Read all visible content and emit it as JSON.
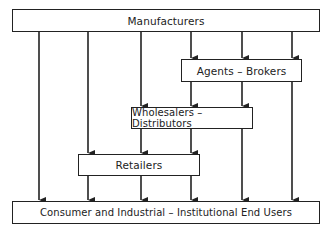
{
  "diagram": {
    "type": "flow",
    "nodes": [
      {
        "id": "manufacturers",
        "label": "Manufacturers"
      },
      {
        "id": "agents",
        "label": "Agents – Brokers"
      },
      {
        "id": "wholesalers",
        "label": "Wholesalers – Distributors"
      },
      {
        "id": "retailers",
        "label": "Retailers"
      },
      {
        "id": "end_users",
        "label": "Consumer and Industrial – Institutional End Users"
      }
    ],
    "edges": [
      {
        "from": "manufacturers",
        "to": "end_users"
      },
      {
        "from": "manufacturers",
        "to": "retailers"
      },
      {
        "from": "manufacturers",
        "to": "wholesalers"
      },
      {
        "from": "manufacturers",
        "to": "agents"
      },
      {
        "from": "manufacturers",
        "to": "agents"
      },
      {
        "from": "manufacturers",
        "to": "agents"
      },
      {
        "from": "agents",
        "to": "wholesalers"
      },
      {
        "from": "agents",
        "to": "wholesalers"
      },
      {
        "from": "agents",
        "to": "end_users"
      },
      {
        "from": "wholesalers",
        "to": "retailers"
      },
      {
        "from": "wholesalers",
        "to": "retailers"
      },
      {
        "from": "wholesalers",
        "to": "end_users"
      },
      {
        "from": "retailers",
        "to": "end_users"
      },
      {
        "from": "retailers",
        "to": "end_users"
      },
      {
        "from": "retailers",
        "to": "end_users"
      }
    ],
    "colors": {
      "line": "#222222",
      "background": "#ffffff"
    }
  }
}
